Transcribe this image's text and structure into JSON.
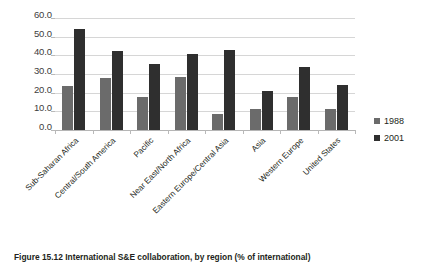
{
  "chart_data": {
    "type": "bar",
    "title": "",
    "xlabel": "",
    "ylabel": "",
    "ylim": [
      0,
      60
    ],
    "ytick_step": 10,
    "ytick_labels": [
      "0.0",
      "10.0",
      "20.0",
      "30.0",
      "40.0",
      "50.0",
      "60.0"
    ],
    "grid": true,
    "legend_position": "right",
    "categories": [
      "Sub-Saharan Africa",
      "Central/South America",
      "Pacific",
      "Near East/North Africa",
      "Eastern Europe/Central Asia",
      "Asia",
      "Western Europe",
      "United States"
    ],
    "series": [
      {
        "name": "1988",
        "color": "#6b6b6b",
        "values": [
          23.5,
          28.0,
          17.5,
          28.5,
          8.5,
          11.5,
          17.5,
          11.0
        ]
      },
      {
        "name": "2001",
        "color": "#2f2f2f",
        "values": [
          54.0,
          42.5,
          35.5,
          40.5,
          43.0,
          21.0,
          33.5,
          24.0
        ]
      }
    ]
  },
  "legend": {
    "items": [
      {
        "label": "1988",
        "color": "#6b6b6b"
      },
      {
        "label": "2001",
        "color": "#2f2f2f"
      }
    ]
  },
  "caption": {
    "text": "Figure 15.12 International S&E collaboration, by region (% of international)"
  }
}
